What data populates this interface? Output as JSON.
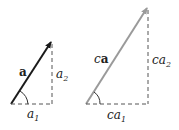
{
  "diagram": {
    "left": {
      "vector_label": "a",
      "vertical_component_label": "a",
      "vertical_component_sub": "2",
      "horizontal_component_label": "a",
      "horizontal_component_sub": "1",
      "color": "#1a1a1a"
    },
    "right": {
      "scalar": "c",
      "vector_label": "a",
      "vertical_component_label": "ca",
      "vertical_component_sub": "2",
      "horizontal_component_label": "ca",
      "horizontal_component_sub": "1",
      "color": "#9a9a9a"
    }
  }
}
